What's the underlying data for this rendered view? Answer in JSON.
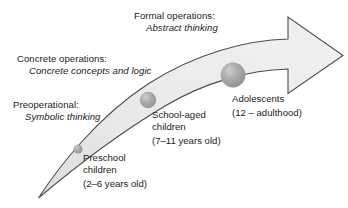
{
  "figure": {
    "colors": {
      "arrow_fill_light": "#ededed",
      "arrow_fill_dark": "#d4d4d4",
      "arrow_stroke": "#4a4a4a",
      "dot_fill": "#9a9a9a",
      "dot_highlight": "#c4c4c4",
      "text": "#1d1d1d",
      "background": "#ffffff"
    }
  },
  "stages": [
    {
      "id": "formal",
      "name": "Formal operations:",
      "description": "Abstract thinking"
    },
    {
      "id": "concrete",
      "name": "Concrete operations:",
      "description": "Concrete concepts and logic"
    },
    {
      "id": "preoperational",
      "name": "Preoperational:",
      "description": "Symbolic thinking"
    }
  ],
  "age_groups": [
    {
      "id": "preschool",
      "line1": "Preschool",
      "line2": "children",
      "age": "(2–6 years old)"
    },
    {
      "id": "school-aged",
      "line1": "School-aged",
      "line2": "children",
      "age": "(7–11 years old)"
    },
    {
      "id": "adolescents",
      "line1": "Adolescents",
      "line2": "",
      "age": "(12 – adulthood)"
    }
  ],
  "markers": [
    {
      "id": "preschool-dot",
      "cx": 78,
      "cy": 149,
      "r": 4.6
    },
    {
      "id": "school-aged-dot",
      "cx": 148,
      "cy": 100,
      "r": 8.2
    },
    {
      "id": "adolescents-dot",
      "cx": 233,
      "cy": 75,
      "r": 12.4
    }
  ]
}
